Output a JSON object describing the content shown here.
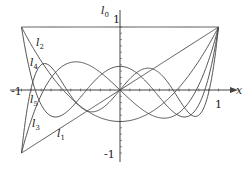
{
  "diagram": {
    "axes": {
      "x_label": "x",
      "x_tick_neg": "-1",
      "x_tick_pos": "1",
      "y_tick_pos": "1",
      "y_tick_neg": "-1"
    },
    "curves": [
      {
        "name": "l",
        "sub": "0",
        "degree": 0,
        "label_x": 101,
        "label_y": 5
      },
      {
        "name": "l",
        "sub": "1",
        "degree": 1,
        "label_x": 57,
        "label_y": 128
      },
      {
        "name": "l",
        "sub": "2",
        "degree": 2,
        "label_x": 36,
        "label_y": 37
      },
      {
        "name": "l",
        "sub": "3",
        "degree": 3,
        "label_x": 32,
        "label_y": 118
      },
      {
        "name": "l",
        "sub": "4",
        "degree": 4,
        "label_x": 30,
        "label_y": 57
      },
      {
        "name": "l",
        "sub": "5",
        "degree": 5,
        "label_x": 30,
        "label_y": 94
      }
    ],
    "stroke_color": "#444444"
  }
}
